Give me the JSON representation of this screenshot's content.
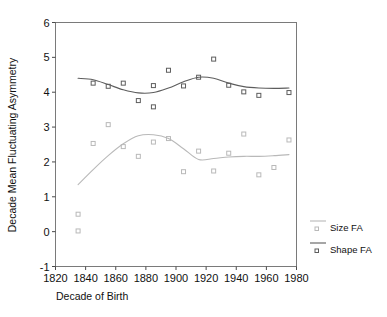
{
  "chart_data": {
    "type": "scatter",
    "title": "",
    "xlabel": "Decade of Birth",
    "ylabel": "Decade Mean Fluctuating Asymmetry",
    "xlim": [
      1820,
      1980
    ],
    "ylim": [
      -1,
      6
    ],
    "xticks": [
      "1820",
      "1840",
      "1860",
      "1880",
      "1900",
      "1920",
      "1940",
      "1960",
      "1980"
    ],
    "xtick_values": [
      1820,
      1840,
      1860,
      1880,
      1900,
      1920,
      1940,
      1960,
      1980
    ],
    "yticks": [
      "6",
      "5",
      "4",
      "3",
      "2",
      "1",
      "0",
      "-1"
    ],
    "ytick_values": [
      6,
      5,
      4,
      3,
      2,
      1,
      0,
      -1
    ],
    "grid": false,
    "legend_position": "right",
    "series": [
      {
        "name": "Size FA",
        "color": "#b9b9b9",
        "marker": "open-square",
        "x": [
          1835,
          1835,
          1845,
          1855,
          1865,
          1875,
          1885,
          1895,
          1905,
          1915,
          1925,
          1935,
          1945,
          1955,
          1965,
          1975
        ],
        "y": [
          0.5,
          0.02,
          2.53,
          3.07,
          2.44,
          2.16,
          2.57,
          2.67,
          1.72,
          2.31,
          1.74,
          2.25,
          2.8,
          1.63,
          1.84,
          2.63
        ],
        "fit_x": [
          1835,
          1845,
          1855,
          1865,
          1875,
          1885,
          1895,
          1905,
          1915,
          1925,
          1935,
          1945,
          1955,
          1965,
          1975
        ],
        "fit_y": [
          1.35,
          1.78,
          2.18,
          2.52,
          2.75,
          2.78,
          2.67,
          2.38,
          2.07,
          2.1,
          2.14,
          2.16,
          2.16,
          2.18,
          2.21
        ]
      },
      {
        "name": "Shape FA",
        "color": "#5d5d5d",
        "marker": "open-square",
        "x": [
          1845,
          1855,
          1865,
          1875,
          1885,
          1885,
          1895,
          1905,
          1915,
          1925,
          1935,
          1945,
          1955,
          1975
        ],
        "y": [
          4.26,
          4.17,
          4.26,
          3.76,
          4.19,
          3.58,
          4.63,
          4.18,
          4.43,
          4.95,
          4.2,
          4.01,
          3.91,
          3.99
        ],
        "fit_x": [
          1835,
          1845,
          1855,
          1865,
          1875,
          1885,
          1895,
          1905,
          1915,
          1925,
          1935,
          1945,
          1955,
          1965,
          1975
        ],
        "fit_y": [
          4.4,
          4.36,
          4.22,
          4.07,
          3.98,
          3.99,
          4.12,
          4.3,
          4.43,
          4.4,
          4.26,
          4.16,
          4.12,
          4.11,
          4.12
        ]
      }
    ]
  },
  "legend": {
    "items": [
      {
        "label": "Size FA",
        "color": "#b9b9b9"
      },
      {
        "label": "Shape FA",
        "color": "#5d5d5d"
      }
    ]
  }
}
